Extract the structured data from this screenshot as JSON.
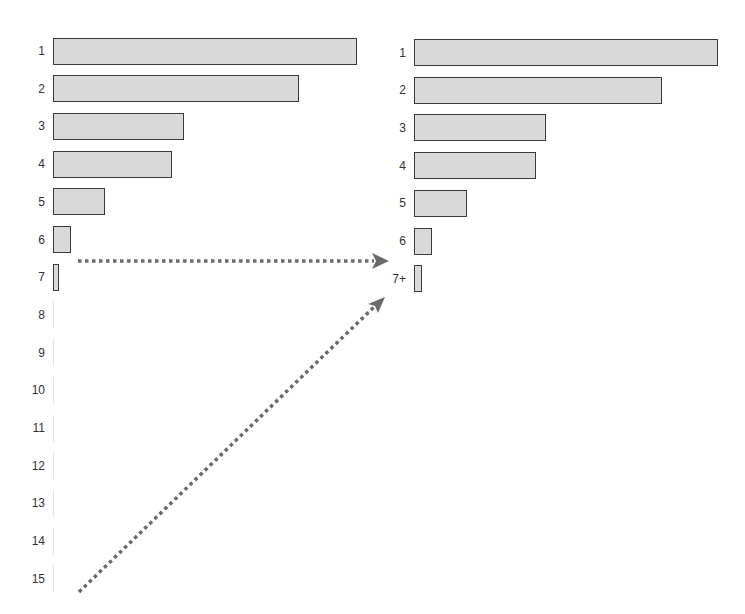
{
  "chart_data": [
    {
      "type": "bar",
      "orientation": "horizontal",
      "title": "",
      "xlabel": "",
      "ylabel": "",
      "categories": [
        "1",
        "2",
        "3",
        "4",
        "5",
        "6",
        "7",
        "8",
        "9",
        "10",
        "11",
        "12",
        "13",
        "14",
        "15"
      ],
      "values": [
        100,
        81,
        43,
        39,
        17,
        6,
        2,
        0.3,
        0.3,
        0.3,
        0.3,
        0.3,
        0.3,
        0.3,
        0.3
      ],
      "xlim": [
        0,
        100
      ],
      "grid": false,
      "legend": null
    },
    {
      "type": "bar",
      "orientation": "horizontal",
      "title": "",
      "xlabel": "",
      "ylabel": "",
      "categories": [
        "1",
        "2",
        "3",
        "4",
        "5",
        "6",
        "7+"
      ],
      "values": [
        100,
        81.5,
        43.5,
        40,
        17.5,
        6,
        2.6
      ],
      "xlim": [
        0,
        100
      ],
      "grid": false,
      "legend": null
    }
  ],
  "annotations": {
    "arrows": [
      {
        "name": "arrow-row7-to-7plus",
        "from": "left chart row 7",
        "to": "right chart row 7+",
        "style": "dotted"
      },
      {
        "name": "arrow-row15-to-7plus",
        "from": "left chart row 15",
        "to": "right chart row 7+",
        "style": "dotted"
      }
    ]
  },
  "colors": {
    "bar_fill": "#d9d9d9",
    "bar_border": "#3a3a3a",
    "arrow": "#6a6a6a",
    "label": "#333333"
  }
}
